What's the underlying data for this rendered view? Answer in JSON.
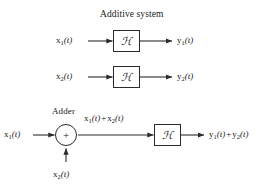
{
  "figure": {
    "title": "Additive system",
    "adder_label": "Adder",
    "adder_symbol": "+",
    "block_symbol": "ℋ",
    "stroke_color": "#2b2b2b",
    "text_color": "#1a1a1a",
    "background_color": "#ffffff"
  },
  "rows": [
    {
      "name": "row-1",
      "input": {
        "var": "x",
        "sub": "1",
        "arg": "(t)",
        "text": "x₁(t)"
      },
      "block": "ℋ",
      "output": {
        "var": "y",
        "sub": "1",
        "arg": "(t)",
        "text": "y₁(t)"
      }
    },
    {
      "name": "row-2",
      "input": {
        "var": "x",
        "sub": "2",
        "arg": "(t)",
        "text": "x₂(t)"
      },
      "block": "ℋ",
      "output": {
        "var": "y",
        "sub": "2",
        "arg": "(t)",
        "text": "y₂(t)"
      }
    },
    {
      "name": "row-3",
      "input_top": {
        "var": "x",
        "sub": "1",
        "arg": "(t)",
        "text": "x₁(t)"
      },
      "input_bottom": {
        "var": "x",
        "sub": "2",
        "arg": "(t)",
        "text": "x₂(t)"
      },
      "sum_label": {
        "text": "x₁(t) + x₂(t)",
        "left": {
          "var": "x",
          "sub": "1",
          "arg": "(t)"
        },
        "op": "+",
        "right": {
          "var": "x",
          "sub": "2",
          "arg": "(t)"
        }
      },
      "block": "ℋ",
      "output": {
        "text": "y₁(t) + y₂(t)",
        "left": {
          "var": "y",
          "sub": "1",
          "arg": "(t)"
        },
        "op": "+",
        "right": {
          "var": "y",
          "sub": "2",
          "arg": "(t)"
        }
      }
    }
  ]
}
